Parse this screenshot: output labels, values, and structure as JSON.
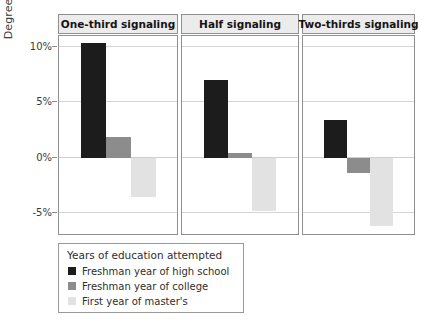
{
  "chart_data": {
    "type": "bar",
    "title": "",
    "xlabel": "",
    "ylabel": "Degree return",
    "ylim": [
      -7.5,
      11.5
    ],
    "yticks": [
      10,
      5,
      0,
      -5
    ],
    "ytick_labels": [
      "10%",
      "5%",
      "0%",
      "-5%"
    ],
    "grid": true,
    "legend_position": "bottom-left",
    "legend_title": "Years of education attempted",
    "facet_labels": [
      "One-third signaling",
      "Half signaling",
      "Two-thirds signaling"
    ],
    "categories": [
      "One-third signaling",
      "Half signaling",
      "Two-thirds signaling"
    ],
    "series": [
      {
        "name": "Freshman year of high school",
        "color": "#1c1c1c",
        "values": [
          10.4,
          7.0,
          3.4
        ]
      },
      {
        "name": "Freshman year of college",
        "color": "#8c8c8c",
        "values": [
          1.9,
          0.4,
          -1.4
        ]
      },
      {
        "name": "First year of master's",
        "color": "#e2e2e2",
        "values": [
          -3.6,
          -4.8,
          -6.2
        ]
      }
    ]
  },
  "axis": {
    "y_title": "Degree return",
    "ticks": [
      {
        "label": "10%",
        "value": 10
      },
      {
        "label": "5%",
        "value": 5
      },
      {
        "label": "0%",
        "value": 0
      },
      {
        "label": "-5%",
        "value": -5
      }
    ]
  },
  "panels": [
    {
      "title": "One-third signaling"
    },
    {
      "title": "Half signaling"
    },
    {
      "title": "Two-thirds signaling"
    }
  ],
  "legend": {
    "title": "Years of education attempted",
    "items": [
      {
        "label": "Freshman year of high school",
        "color": "#1c1c1c"
      },
      {
        "label": "Freshman year of college",
        "color": "#8c8c8c"
      },
      {
        "label": "First year of master's",
        "color": "#e2e2e2"
      }
    ]
  },
  "colors": {
    "panel_strip_bg": "#ececec",
    "panel_border": "#8f8f8f",
    "gridline": "#d4d4d4",
    "text": "#2e2e2e"
  }
}
